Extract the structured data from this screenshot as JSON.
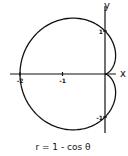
{
  "chart_data": {
    "type": "line",
    "title": "",
    "caption": "r = 1 - cos θ",
    "equation": {
      "form": "polar",
      "r": "1 - cos(theta)",
      "theta_range": [
        0,
        6.283185
      ]
    },
    "xlabel": "x",
    "ylabel": "y",
    "xlim": [
      -2.2,
      0.3
    ],
    "ylim": [
      -1.4,
      1.6
    ],
    "x_ticks": [
      {
        "value": -2,
        "label": "-2"
      },
      {
        "value": -1,
        "label": "-1"
      }
    ],
    "y_ticks": [
      {
        "value": 1,
        "label": "1"
      },
      {
        "value": -1,
        "label": "-1"
      }
    ],
    "grid": false,
    "legend": "none",
    "series": [
      {
        "name": "cardioid",
        "color": "#111111"
      }
    ]
  }
}
